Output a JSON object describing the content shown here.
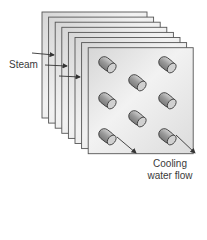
{
  "diagram": {
    "labels": {
      "steam": "Steam",
      "cooling_line1": "Cooling",
      "cooling_line2": "water flow"
    },
    "plates": {
      "count": 8,
      "back_origin": [
        42,
        12
      ],
      "offset": [
        6.6,
        5.1
      ],
      "width": 105,
      "height": 106
    },
    "tubes": [
      {
        "row": 0,
        "col": 0
      },
      {
        "row": 0,
        "col": 2
      },
      {
        "row": 0.5,
        "col": 1
      },
      {
        "row": 1,
        "col": 0
      },
      {
        "row": 1,
        "col": 2
      },
      {
        "row": 1.5,
        "col": 1
      },
      {
        "row": 2,
        "col": 0
      },
      {
        "row": 2,
        "col": 2
      }
    ],
    "colors": {
      "plate_fill": "#e8e8e8",
      "plate_stroke": "#555555",
      "tube_fill": "#b0b0b0",
      "tube_end": "#d0d0d0",
      "arrow": "#333333"
    }
  }
}
